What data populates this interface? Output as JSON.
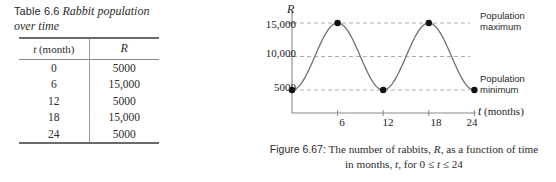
{
  "table": {
    "number": "Table 6.6",
    "title_line1": "Rabbit population",
    "title_line2": "over time",
    "columns": [
      "t (month)",
      "R"
    ],
    "col_t_label": "t",
    "col_t_unit": " (month)",
    "col_r_label": "R",
    "rows": [
      {
        "t": "0",
        "R": "5000"
      },
      {
        "t": "6",
        "R": "15,000"
      },
      {
        "t": "12",
        "R": "5000"
      },
      {
        "t": "18",
        "R": "15,000"
      },
      {
        "t": "24",
        "R": "5000"
      }
    ]
  },
  "figure": {
    "number": "Figure 6.67:",
    "caption_line1_a": " The number of rabbits, ",
    "caption_line1_R": "R",
    "caption_line1_b": ", as a function of time",
    "caption_line2_a": "in months, ",
    "caption_line2_t": "t",
    "caption_line2_b": ", for 0 ≤ ",
    "caption_line2_t2": "t",
    "caption_line2_c": " ≤ 24",
    "ylabel": "R",
    "xlabel_var": "t",
    "xlabel_unit": " (months)",
    "annotation_max_line1": "Population",
    "annotation_max_line2": "maximum",
    "annotation_min_line1": "Population",
    "annotation_min_line2": "minimum",
    "colors": {
      "curve": "#6b6b6b",
      "axis": "#8a8a8a",
      "gridline": "#9a9a9a",
      "point": "#111111",
      "text": "#222222"
    }
  },
  "chart_data": {
    "type": "line",
    "xlabel": "t (months)",
    "ylabel": "R",
    "xlim": [
      0,
      26
    ],
    "ylim": [
      0,
      17000
    ],
    "xticks": [
      6,
      12,
      18,
      24
    ],
    "xtick_labels": [
      "6",
      "12",
      "18",
      "24"
    ],
    "yticks": [
      5000,
      10000,
      15000
    ],
    "ytick_labels": [
      "5000",
      "10,000",
      "15,000"
    ],
    "grid": "horizontal-dashed",
    "legend": "none",
    "series": [
      {
        "name": "Rabbit population R(t)",
        "form": "sinusoid",
        "amplitude": 5000,
        "midline": 10000,
        "period": 12,
        "phase_min_at": 0,
        "x": [
          0,
          6,
          12,
          18,
          24
        ],
        "y": [
          5000,
          15000,
          5000,
          15000,
          5000
        ]
      }
    ],
    "markers": {
      "shown_at_x": [
        0,
        6,
        12,
        18,
        24
      ],
      "shown_at_y": [
        5000,
        15000,
        5000,
        15000,
        5000
      ],
      "style": "filled-circle"
    },
    "annotations": [
      {
        "text": "Population maximum",
        "y": 15000,
        "position": "right"
      },
      {
        "text": "Population minimum",
        "y": 5000,
        "position": "right"
      }
    ]
  }
}
